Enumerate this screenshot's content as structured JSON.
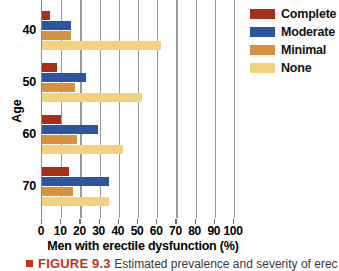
{
  "chart_data": {
    "type": "bar",
    "orientation": "horizontal",
    "title": "",
    "xlabel": "Men with erectile dysfunction (%)",
    "ylabel": "Age",
    "categories": [
      "40",
      "50",
      "60",
      "70"
    ],
    "xlim": [
      0,
      100
    ],
    "xticks": [
      0,
      10,
      20,
      30,
      40,
      50,
      60,
      70,
      80,
      90,
      100
    ],
    "grid": "vertical",
    "legend_position": "top-right",
    "series": [
      {
        "name": "Complete",
        "color": "#a82f17",
        "values": [
          4,
          8,
          10,
          14
        ]
      },
      {
        "name": "Moderate",
        "color": "#2b55a0",
        "values": [
          15,
          23,
          29,
          35
        ]
      },
      {
        "name": "Minimal",
        "color": "#d9913f",
        "values": [
          15,
          17,
          18,
          16
        ]
      },
      {
        "name": "None",
        "color": "#f5d17e",
        "values": [
          62,
          52,
          42,
          35
        ]
      }
    ]
  },
  "caption": {
    "figure_number": "FIGURE 9.3",
    "text": "Estimated prevalence and severity of erec"
  }
}
